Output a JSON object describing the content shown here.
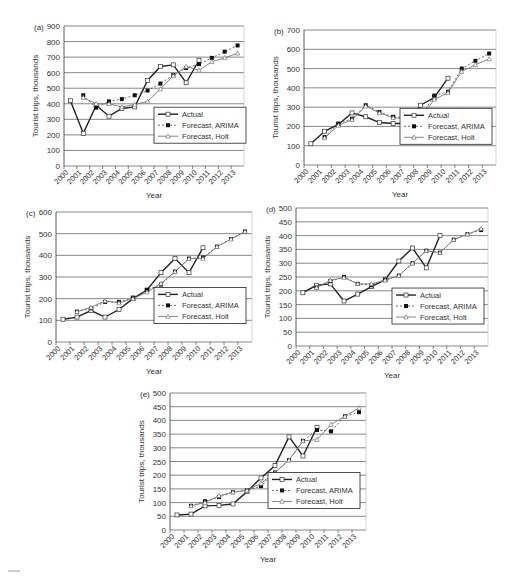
{
  "years": [
    "2000",
    "2001",
    "2002",
    "2003",
    "2004",
    "2005",
    "2006",
    "2007",
    "2008",
    "2009",
    "2010",
    "2011",
    "2012",
    "2013"
  ],
  "legend": {
    "actual": "Actual",
    "arima": "Forecast, ARIMA",
    "holt": "Forecast, Holt"
  },
  "xlabel": "Year",
  "ylabel": "Tourist trips, thousands",
  "chart_data": [
    {
      "type": "line",
      "panel": "(a)",
      "ylim": [
        0,
        900
      ],
      "yticks": [
        0,
        100,
        200,
        300,
        400,
        500,
        600,
        700,
        800,
        900
      ],
      "xlabel": "Year",
      "ylabel": "Tourist trips, thousands",
      "categories": [
        "2000",
        "2001",
        "2002",
        "2003",
        "2004",
        "2005",
        "2006",
        "2007",
        "2008",
        "2009",
        "2010",
        "2011",
        "2012",
        "2013"
      ],
      "series": [
        {
          "name": "Actual",
          "values": [
            420,
            210,
            390,
            320,
            370,
            380,
            550,
            640,
            650,
            535,
            680,
            null,
            null,
            null
          ]
        },
        {
          "name": "Forecast, ARIMA",
          "values": [
            null,
            455,
            375,
            415,
            430,
            455,
            485,
            530,
            585,
            630,
            655,
            695,
            735,
            775
          ]
        },
        {
          "name": "Forecast, Holt",
          "values": [
            null,
            440,
            400,
            400,
            380,
            395,
            415,
            495,
            580,
            640,
            615,
            670,
            695,
            725
          ]
        }
      ]
    },
    {
      "type": "line",
      "panel": "(b)",
      "ylim": [
        0,
        700
      ],
      "yticks": [
        0,
        100,
        200,
        300,
        400,
        500,
        600,
        700
      ],
      "xlabel": "Year",
      "ylabel": "Tourist trips, thousands",
      "categories": [
        "2000",
        "2001",
        "2002",
        "2003",
        "2004",
        "2005",
        "2006",
        "2007",
        "2008",
        "2009",
        "2010",
        "2011",
        "2012",
        "2013"
      ],
      "series": [
        {
          "name": "Actual",
          "values": [
            110,
            175,
            210,
            270,
            250,
            220,
            215,
            215,
            310,
            350,
            450,
            null,
            null,
            null
          ]
        },
        {
          "name": "Forecast, ARIMA",
          "values": [
            null,
            145,
            215,
            240,
            310,
            275,
            250,
            245,
            250,
            360,
            380,
            500,
            540,
            578
          ]
        },
        {
          "name": "Forecast, Holt",
          "values": [
            null,
            140,
            205,
            235,
            305,
            270,
            245,
            240,
            245,
            340,
            375,
            485,
            520,
            550
          ]
        }
      ]
    },
    {
      "type": "line",
      "panel": "(c)",
      "ylim": [
        0,
        600
      ],
      "yticks": [
        0,
        100,
        200,
        300,
        400,
        500,
        600
      ],
      "xlabel": "Year",
      "ylabel": "Tourist trips, thousands",
      "categories": [
        "2000",
        "2001",
        "2002",
        "2003",
        "2004",
        "2005",
        "2006",
        "2007",
        "2008",
        "2009",
        "2010",
        "2011",
        "2012",
        "2013"
      ],
      "series": [
        {
          "name": "Actual",
          "values": [
            105,
            115,
            145,
            115,
            150,
            200,
            240,
            320,
            385,
            320,
            435,
            null,
            null,
            null
          ]
        },
        {
          "name": "Forecast, ARIMA",
          "values": [
            null,
            140,
            155,
            185,
            185,
            205,
            240,
            265,
            325,
            385,
            390,
            440,
            475,
            510
          ]
        },
        {
          "name": "Forecast, Holt",
          "values": [
            null,
            140,
            160,
            190,
            180,
            200,
            230,
            270,
            325,
            385,
            385,
            440,
            475,
            510
          ]
        }
      ]
    },
    {
      "type": "line",
      "panel": "(d)",
      "ylim": [
        0,
        500
      ],
      "yticks": [
        0,
        50,
        100,
        150,
        200,
        250,
        300,
        350,
        400,
        450,
        500
      ],
      "xlabel": "Year",
      "ylabel": "Tourist trips, thousands",
      "categories": [
        "2000",
        "2001",
        "2002",
        "2003",
        "2004",
        "2005",
        "2006",
        "2007",
        "2008",
        "2009",
        "2010",
        "2011",
        "2012",
        "2013"
      ],
      "series": [
        {
          "name": "Actual",
          "values": [
            193,
            220,
            225,
            163,
            188,
            215,
            240,
            308,
            355,
            283,
            400,
            null,
            null,
            null
          ]
        },
        {
          "name": "Forecast, ARIMA",
          "values": [
            null,
            212,
            235,
            250,
            225,
            220,
            240,
            255,
            300,
            345,
            338,
            385,
            405,
            420
          ]
        },
        {
          "name": "Forecast, Holt",
          "values": [
            null,
            212,
            238,
            248,
            225,
            225,
            238,
            255,
            300,
            345,
            338,
            385,
            405,
            425
          ]
        }
      ]
    },
    {
      "type": "line",
      "panel": "(e)",
      "ylim": [
        0,
        500
      ],
      "yticks": [
        0,
        50,
        100,
        150,
        200,
        250,
        300,
        350,
        400,
        450,
        500
      ],
      "xlabel": "Year",
      "ylabel": "Tourist trips, thousands",
      "categories": [
        "2000",
        "2001",
        "2002",
        "2003",
        "2004",
        "2005",
        "2006",
        "2007",
        "2008",
        "2009",
        "2010",
        "2011",
        "2012",
        "2013"
      ],
      "series": [
        {
          "name": "Actual",
          "values": [
            55,
            58,
            88,
            90,
            95,
            140,
            190,
            235,
            340,
            270,
            375,
            null,
            null,
            null
          ]
        },
        {
          "name": "Forecast, ARIMA",
          "values": [
            null,
            88,
            105,
            120,
            138,
            145,
            160,
            210,
            255,
            325,
            365,
            360,
            415,
            430
          ]
        },
        {
          "name": "Forecast, Holt",
          "values": [
            null,
            88,
            100,
            125,
            138,
            145,
            170,
            210,
            255,
            325,
            330,
            385,
            415,
            445
          ]
        }
      ]
    }
  ],
  "panels": [
    {
      "label": "(a)",
      "left": 8,
      "top": 8,
      "width": 245,
      "height": 190,
      "plot": {
        "x": 56,
        "y": 18,
        "w": 180,
        "h": 140
      }
    },
    {
      "label": "(b)",
      "left": 256,
      "top": 8,
      "width": 245,
      "height": 190,
      "plot": {
        "x": 48,
        "y": 22,
        "w": 192,
        "h": 135
      }
    },
    {
      "label": "(c)",
      "left": 8,
      "top": 200,
      "width": 245,
      "height": 180,
      "plot": {
        "x": 48,
        "y": 12,
        "w": 196,
        "h": 130
      }
    },
    {
      "label": "(d)",
      "left": 256,
      "top": 200,
      "width": 245,
      "height": 180,
      "plot": {
        "x": 40,
        "y": 8,
        "w": 192,
        "h": 138
      }
    },
    {
      "label": "(e)",
      "left": 128,
      "top": 385,
      "width": 250,
      "height": 190,
      "plot": {
        "x": 42,
        "y": 8,
        "w": 196,
        "h": 137
      }
    }
  ]
}
